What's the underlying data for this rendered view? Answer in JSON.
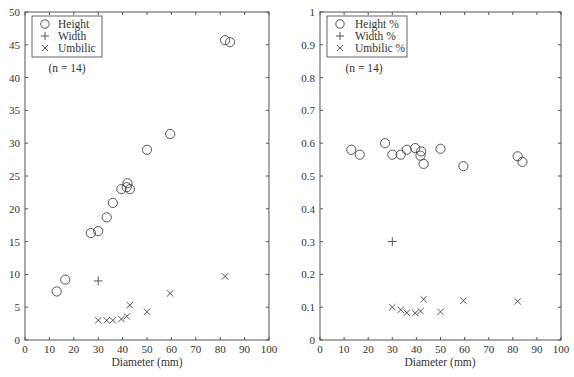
{
  "chart_data": [
    {
      "type": "scatter",
      "title": "",
      "xlabel": "Diameter (mm)",
      "ylabel": "",
      "xlim": [
        0,
        100
      ],
      "ylim": [
        0,
        50
      ],
      "xticks": [
        0,
        10,
        20,
        30,
        40,
        50,
        60,
        70,
        80,
        90,
        100
      ],
      "yticks": [
        0,
        5,
        10,
        15,
        20,
        25,
        30,
        35,
        40,
        45,
        50
      ],
      "grid": false,
      "legend_position": "upper left",
      "annotation": "(n = 14)",
      "series": [
        {
          "name": "Height",
          "marker": "circle",
          "points": [
            [
              13,
              7.4
            ],
            [
              16.5,
              9.2
            ],
            [
              27,
              16.3
            ],
            [
              30,
              16.6
            ],
            [
              33.5,
              18.7
            ],
            [
              36,
              20.9
            ],
            [
              39.5,
              23.0
            ],
            [
              41.7,
              23.3
            ],
            [
              42,
              23.9
            ],
            [
              43,
              23.0
            ],
            [
              50,
              29.0
            ],
            [
              59.5,
              31.4
            ],
            [
              82,
              45.7
            ],
            [
              84,
              45.4
            ]
          ]
        },
        {
          "name": "Width",
          "marker": "plus",
          "points": [
            [
              30,
              9.0
            ]
          ]
        },
        {
          "name": "Umbilic",
          "marker": "x",
          "points": [
            [
              30,
              3.0
            ],
            [
              33.5,
              3.0
            ],
            [
              36,
              3.0
            ],
            [
              39.5,
              3.2
            ],
            [
              41.7,
              3.6
            ],
            [
              43,
              5.3
            ],
            [
              50,
              4.3
            ],
            [
              59.5,
              7.1
            ],
            [
              82,
              9.7
            ]
          ]
        }
      ]
    },
    {
      "type": "scatter",
      "title": "",
      "xlabel": "Diameter (mm)",
      "ylabel": "",
      "xlim": [
        0,
        100
      ],
      "ylim": [
        0,
        1
      ],
      "xticks": [
        0,
        10,
        20,
        30,
        40,
        50,
        60,
        70,
        80,
        90,
        100
      ],
      "yticks": [
        0,
        0.1,
        0.2,
        0.3,
        0.4,
        0.5,
        0.6,
        0.7,
        0.8,
        0.9,
        1
      ],
      "grid": false,
      "legend_position": "upper left",
      "annotation": "(n = 14)",
      "series": [
        {
          "name": "Height %",
          "marker": "circle",
          "points": [
            [
              13,
              0.58
            ],
            [
              16.5,
              0.565
            ],
            [
              27,
              0.6
            ],
            [
              30,
              0.565
            ],
            [
              33.5,
              0.565
            ],
            [
              36,
              0.58
            ],
            [
              39.5,
              0.585
            ],
            [
              42,
              0.575
            ],
            [
              41.7,
              0.562
            ],
            [
              43,
              0.537
            ],
            [
              50,
              0.583
            ],
            [
              59.5,
              0.53
            ],
            [
              82,
              0.56
            ],
            [
              84,
              0.543
            ]
          ]
        },
        {
          "name": "Width %",
          "marker": "plus",
          "points": [
            [
              30,
              0.3
            ]
          ]
        },
        {
          "name": "Umbilic %",
          "marker": "x",
          "points": [
            [
              30,
              0.1
            ],
            [
              33.5,
              0.092
            ],
            [
              36,
              0.083
            ],
            [
              39.5,
              0.082
            ],
            [
              41.7,
              0.088
            ],
            [
              43,
              0.124
            ],
            [
              50,
              0.086
            ],
            [
              59.5,
              0.12
            ],
            [
              82,
              0.118
            ]
          ]
        }
      ]
    }
  ],
  "labels": {
    "left": {
      "xlabel": "Diameter (mm)",
      "legend": [
        "Height",
        "Width",
        "Umbilic"
      ],
      "annotation": "(n = 14)"
    },
    "right": {
      "xlabel": "Diameter (mm)",
      "legend": [
        "Height %",
        "Width %",
        "Umbilic %"
      ],
      "annotation": "(n = 14)"
    }
  }
}
